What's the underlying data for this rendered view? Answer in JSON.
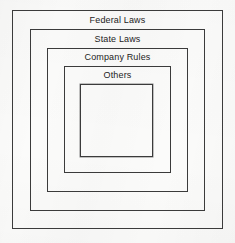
{
  "diagram": {
    "type": "nested-rectangles",
    "background_color": "#fbfbfa",
    "line_color": "#3b3b3b",
    "text_color": "#232323",
    "levels": [
      {
        "label": "Federal Laws",
        "order": 1,
        "x": 12,
        "y": 10,
        "width": 211,
        "height": 219
      },
      {
        "label": "State Laws",
        "order": 2,
        "x": 30,
        "y": 29,
        "width": 175,
        "height": 182
      },
      {
        "label": "Company Rules",
        "order": 3,
        "x": 47,
        "y": 48,
        "width": 141,
        "height": 144
      },
      {
        "label": "Others",
        "order": 4,
        "x": 64,
        "y": 66,
        "width": 107,
        "height": 107
      },
      {
        "label": "",
        "order": 5,
        "x": 80,
        "y": 84,
        "width": 73,
        "height": 73
      }
    ]
  }
}
